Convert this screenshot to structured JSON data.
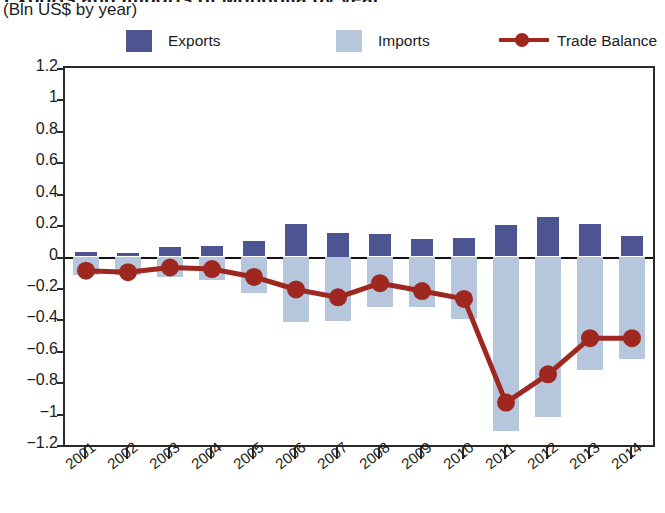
{
  "header": {
    "title_clipped": "Exports and Imports of Mongolia by year",
    "subtitle": "(Bln US$ by year)"
  },
  "legend": {
    "items": [
      {
        "label": "Exports",
        "type": "swatch",
        "color": "#4c5591",
        "icon": "square-swatch-icon"
      },
      {
        "label": "Imports",
        "type": "swatch",
        "color": "#b6c6dc",
        "icon": "square-swatch-icon"
      },
      {
        "label": "Trade Balance",
        "type": "line",
        "color": "#9e2820",
        "icon": "line-marker-icon"
      }
    ]
  },
  "axes": {
    "y_ticks": [
      "1.2",
      "1",
      "0.8",
      "0.6",
      "0.4",
      "0.2",
      "0",
      "−0.2",
      "−0.4",
      "−0.6",
      "−0.8",
      "−1",
      "−1.2"
    ],
    "x_ticks": [
      "2001",
      "2002",
      "2003",
      "2004",
      "2005",
      "2006",
      "2007",
      "2008",
      "2009",
      "2010",
      "2011",
      "2012",
      "2013",
      "2014"
    ]
  },
  "chart_data": {
    "type": "bar",
    "title": "Exports and Imports of Mongolia by year",
    "subtitle": "(Bln US$ by year)",
    "xlabel": "",
    "ylabel": "Bln US$",
    "ylim": [
      -1.2,
      1.2
    ],
    "ytick_step": 0.2,
    "grid": false,
    "legend_position": "top",
    "categories": [
      "2001",
      "2002",
      "2003",
      "2004",
      "2005",
      "2006",
      "2007",
      "2008",
      "2009",
      "2010",
      "2011",
      "2012",
      "2013",
      "2014"
    ],
    "series": [
      {
        "name": "Exports",
        "type": "bar",
        "color": "#4c5591",
        "values": [
          0.03,
          0.025,
          0.06,
          0.07,
          0.1,
          0.21,
          0.15,
          0.145,
          0.11,
          0.12,
          0.2,
          0.25,
          0.21,
          0.13
        ]
      },
      {
        "name": "Imports",
        "type": "bar",
        "color": "#b6c6dc",
        "values": [
          -0.12,
          -0.12,
          -0.13,
          -0.15,
          -0.23,
          -0.42,
          -0.41,
          -0.32,
          -0.32,
          -0.4,
          -1.11,
          -1.02,
          -0.72,
          -0.65
        ]
      },
      {
        "name": "Trade Balance",
        "type": "line",
        "color": "#9e2820",
        "values": [
          -0.09,
          -0.1,
          -0.07,
          -0.08,
          -0.13,
          -0.21,
          -0.26,
          -0.17,
          -0.22,
          -0.27,
          -0.93,
          -0.75,
          -0.52,
          -0.52
        ]
      }
    ]
  }
}
